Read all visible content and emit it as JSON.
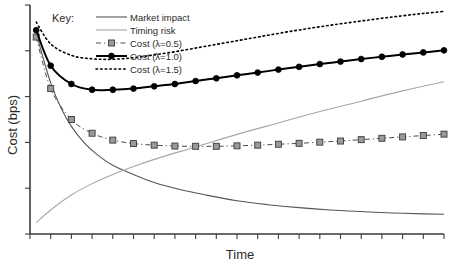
{
  "chart_data": {
    "type": "line",
    "title": "",
    "xlabel": "Time",
    "ylabel": "Cost (bps)",
    "xlim": [
      0,
      20
    ],
    "ylim": [
      0,
      100
    ],
    "grid": false,
    "legend_position": "top-left",
    "legend_title": "Key:",
    "x_tick_labels": [],
    "y_tick_labels": [],
    "x_tick_count": 21,
    "y_tick_count": 6,
    "annotations": [],
    "series": [
      {
        "name": "Market impact",
        "style": "solid",
        "color": "#555555",
        "marker": "none",
        "width": 1.1,
        "x": [
          0.3,
          0.6,
          1.0,
          1.5,
          2.0,
          2.6,
          3.2,
          4.0,
          5.0,
          6.0,
          7.2,
          8.5,
          10.0,
          11.5,
          13.0,
          14.5,
          16.0,
          17.5,
          19.0,
          20.0
        ],
        "y": [
          88.0,
          78.0,
          66.0,
          55.0,
          47.0,
          40.0,
          35.0,
          30.0,
          26.0,
          22.5,
          19.5,
          17.0,
          14.5,
          12.8,
          11.5,
          10.5,
          9.8,
          9.2,
          8.8,
          8.6
        ]
      },
      {
        "name": "Timing risk",
        "style": "solid",
        "color": "#a6a6a6",
        "marker": "none",
        "width": 1.1,
        "x": [
          0.3,
          1.0,
          2.0,
          3.0,
          4.0,
          5.0,
          6.5,
          8.0,
          10.0,
          12.0,
          14.0,
          16.0,
          18.0,
          20.0
        ],
        "y": [
          5.0,
          10.5,
          17.0,
          22.0,
          26.0,
          29.5,
          34.0,
          38.0,
          43.5,
          48.5,
          53.5,
          58.0,
          62.5,
          66.5
        ]
      },
      {
        "name": "Cost (λ=0.5)",
        "style": "dashdot",
        "color": "#4d4d4d",
        "marker": "square",
        "marker_fill": "#9a9a9a",
        "width": 1.0,
        "x": [
          0.3,
          1.0,
          2.0,
          3.0,
          4.0,
          5.0,
          6.0,
          7.0,
          8.0,
          9.0,
          10.0,
          11.0,
          12.0,
          13.0,
          14.0,
          15.0,
          16.0,
          17.0,
          18.0,
          19.0,
          20.0
        ],
        "y": [
          86.0,
          63.5,
          50.0,
          44.0,
          41.0,
          39.5,
          38.8,
          38.4,
          38.3,
          38.3,
          38.5,
          38.8,
          39.2,
          39.6,
          40.1,
          40.6,
          41.2,
          41.8,
          42.4,
          43.0,
          43.6
        ]
      },
      {
        "name": "Cost (λ=1.0)",
        "style": "solid",
        "color": "#000000",
        "marker": "circle",
        "marker_fill": "#000000",
        "width": 2.0,
        "x": [
          0.3,
          1.0,
          2.0,
          3.0,
          4.0,
          5.0,
          6.0,
          7.0,
          8.0,
          9.0,
          10.0,
          11.0,
          12.0,
          13.0,
          14.0,
          15.0,
          16.0,
          17.0,
          18.0,
          19.0,
          20.0
        ],
        "y": [
          89.0,
          73.5,
          65.5,
          63.0,
          63.0,
          63.5,
          64.5,
          65.5,
          66.8,
          68.0,
          69.3,
          70.5,
          71.8,
          73.0,
          74.2,
          75.3,
          76.4,
          77.4,
          78.4,
          79.3,
          80.2
        ]
      },
      {
        "name": "Cost (λ=1.5)",
        "style": "dotted",
        "color": "#000000",
        "marker": "none",
        "width": 1.6,
        "x": [
          0.3,
          1.0,
          2.0,
          3.0,
          4.0,
          5.0,
          6.0,
          7.0,
          8.0,
          9.0,
          10.0,
          11.0,
          12.0,
          13.0,
          14.0,
          15.0,
          16.0,
          17.0,
          18.0,
          19.0,
          20.0
        ],
        "y": [
          92.5,
          83.0,
          78.0,
          76.5,
          76.3,
          77.0,
          78.2,
          79.6,
          81.2,
          82.8,
          84.4,
          86.0,
          87.6,
          89.1,
          90.5,
          91.8,
          93.0,
          94.2,
          95.3,
          96.3,
          97.2
        ]
      }
    ]
  },
  "legend": {
    "title": "Key:",
    "entries": [
      {
        "label": "Market impact"
      },
      {
        "label": "Timing risk"
      },
      {
        "label": "Cost (λ=0.5)"
      },
      {
        "label": "Cost (λ=1.0)"
      },
      {
        "label": "Cost (λ=1.5)"
      }
    ]
  },
  "axes": {
    "x_title": "Time",
    "y_title": "Cost (bps)"
  },
  "colors": {
    "market_impact": "#555555",
    "timing_risk": "#a6a6a6",
    "cost_05": "#4d4d4d",
    "cost_05_marker": "#9a9a9a",
    "cost_10": "#000000",
    "cost_15": "#000000",
    "axis": "#3a3a3a",
    "background": "#ffffff"
  }
}
